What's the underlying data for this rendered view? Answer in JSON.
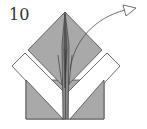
{
  "diagram": {
    "type": "origami-instruction",
    "step_number": "10",
    "colors": {
      "paper_colored": "#a9a9a9",
      "paper_white": "#ffffff",
      "line": "#4a4a4a"
    },
    "annotations": [
      {
        "kind": "arrow",
        "direction": "up-right",
        "meaning": "fold-flap-up-and-over"
      }
    ]
  }
}
